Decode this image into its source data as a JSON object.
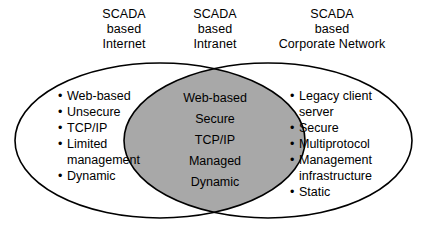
{
  "diagram": {
    "type": "venn",
    "background_color": "#ffffff",
    "stroke_color": "#000000",
    "intersection_fill": "#a8a8a8",
    "headers": {
      "left": {
        "line1": "SCADA",
        "line2": "based",
        "line3": "Internet"
      },
      "center": {
        "line1": "SCADA",
        "line2": "based",
        "line3": "Intranet"
      },
      "right": {
        "line1": "SCADA",
        "line2": "based",
        "line3": "Corporate Network"
      }
    },
    "sets": {
      "left": {
        "name": "SCADA based Internet",
        "items": [
          "Web-based",
          "Unsecure",
          "TCP/IP",
          "Limited\nmanagement",
          "Dynamic"
        ]
      },
      "intersection": {
        "name": "SCADA based Intranet",
        "items": [
          "Web-based",
          "Secure",
          "TCP/IP",
          "Managed",
          "Dynamic"
        ]
      },
      "right": {
        "name": "SCADA based Corporate Network",
        "items": [
          "Legacy client\nserver",
          "Secure",
          "Multiprotocol",
          "Management\ninfrastructure",
          "Static"
        ]
      }
    }
  }
}
